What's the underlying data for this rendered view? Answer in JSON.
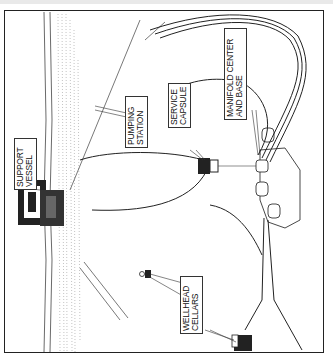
{
  "diagram": {
    "type": "subsea production system illustration (rotated 90°)",
    "colors": {
      "ink": "#222222",
      "paper": "#ffffff",
      "sea_texture": "#9a9a9a"
    },
    "labels": [
      {
        "id": "support-vessel",
        "lines": [
          "SUPPORT",
          "VESSEL"
        ]
      },
      {
        "id": "pumping-station",
        "lines": [
          "PUMPING",
          "STATION"
        ]
      },
      {
        "id": "service-capsule",
        "lines": [
          "SERVICE",
          "CAPSULE"
        ]
      },
      {
        "id": "manifold-center",
        "lines": [
          "MANIFOLD CENTER",
          "AND BASE"
        ]
      },
      {
        "id": "wellhead-cellars",
        "lines": [
          "WELLHEAD",
          "CELLARS"
        ]
      }
    ]
  }
}
